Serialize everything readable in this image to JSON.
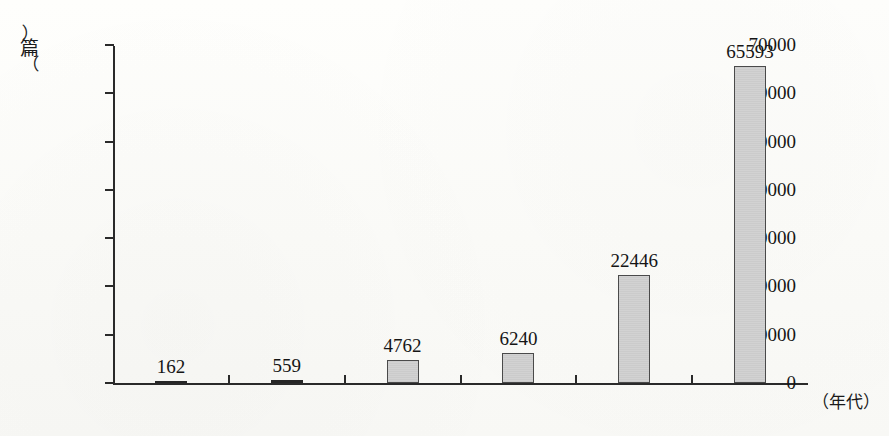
{
  "chart_data": {
    "type": "bar",
    "title": "",
    "subtitle": "",
    "xlabel": "（年代）",
    "ylabel": "（篇）",
    "ylabel_parts": {
      "paren_open": "︵",
      "char": "篇",
      "paren_close": "︶"
    },
    "categories": [
      "1960s",
      "1970s",
      "1980s",
      "1990s",
      "2000s",
      "2010s"
    ],
    "values": [
      162,
      559,
      4762,
      6240,
      22446,
      65593
    ],
    "value_labels": [
      "162",
      "559",
      "4762",
      "6240",
      "22446",
      "65593"
    ],
    "series": [
      {
        "name": "论文数量",
        "values": [
          162,
          559,
          4762,
          6240,
          22446,
          65593
        ]
      }
    ],
    "ylim": [
      0,
      70000
    ],
    "ytick_labels": [
      "0",
      "10000",
      "20000",
      "30000",
      "40000",
      "50000",
      "60000",
      "70000"
    ],
    "ytick_values": [
      0,
      10000,
      20000,
      30000,
      40000,
      50000,
      60000,
      70000
    ],
    "grid": false,
    "legend": false,
    "legend_position": "none",
    "bar_fill_color": "#d2d2d2",
    "bar_border_color": "#4a4a4a",
    "axis_color": "#2a2a2a",
    "background_color": "#fdfdfb"
  }
}
